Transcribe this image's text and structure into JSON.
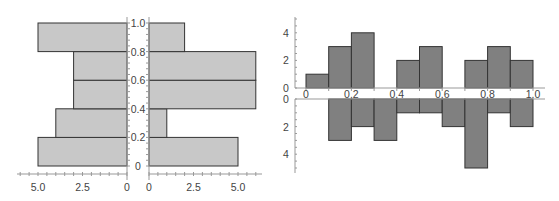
{
  "chart_data": [
    {
      "type": "bar",
      "subtype": "back-to-back horizontal histogram",
      "title": "",
      "bins": [
        "0-0.2",
        "0.2-0.4",
        "0.4-0.6",
        "0.6-0.8",
        "0.8-1.0"
      ],
      "y_ticks": [
        "0",
        "0.2",
        "0.4",
        "0.6",
        "0.8",
        "1.0"
      ],
      "ylim": [
        0,
        1.0
      ],
      "series": [
        {
          "name": "left",
          "values": [
            5,
            4,
            3,
            3,
            5
          ],
          "x_ticks": [
            "5.0",
            "2.5",
            "0"
          ],
          "xlim": [
            0,
            5.5
          ]
        },
        {
          "name": "right",
          "values": [
            5,
            1,
            6,
            6,
            2
          ],
          "x_ticks": [
            "0",
            "2.5",
            "5.0"
          ],
          "xlim": [
            0,
            6
          ]
        }
      ],
      "bar_color": "#c8c8c8",
      "grid": false
    },
    {
      "type": "bar",
      "subtype": "mirrored vertical histogram",
      "title": "",
      "bins": [
        "0-0.1",
        "0.1-0.2",
        "0.2-0.3",
        "0.3-0.4",
        "0.4-0.5",
        "0.5-0.6",
        "0.6-0.7",
        "0.7-0.8",
        "0.8-0.9",
        "0.9-1.0"
      ],
      "x_ticks": [
        "0",
        "0.2",
        "0.4",
        "0.6",
        "0.8",
        "1.0"
      ],
      "xlim": [
        0,
        1.0
      ],
      "series": [
        {
          "name": "upper",
          "values": [
            1,
            3,
            4,
            0,
            2,
            3,
            0,
            2,
            3,
            2
          ],
          "y_ticks": [
            "0",
            "2",
            "4"
          ],
          "ylim": [
            0,
            5
          ]
        },
        {
          "name": "lower",
          "values": [
            0,
            3,
            2,
            3,
            1,
            1,
            2,
            5,
            1,
            2
          ],
          "y_ticks": [
            "0",
            "2",
            "4"
          ],
          "ylim": [
            0,
            5
          ]
        }
      ],
      "bar_color": "#808080",
      "grid": false
    }
  ]
}
